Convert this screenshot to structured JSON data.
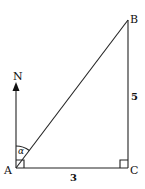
{
  "diagram": {
    "type": "right-triangle bearing diagram",
    "points": {
      "A": {
        "label": "A"
      },
      "B": {
        "label": "B"
      },
      "C": {
        "label": "C"
      }
    },
    "north_label": "N",
    "angle_label": "α",
    "side_AC": "3",
    "side_BC": "5",
    "right_angles": [
      "A (between north and AC)",
      "C"
    ]
  }
}
